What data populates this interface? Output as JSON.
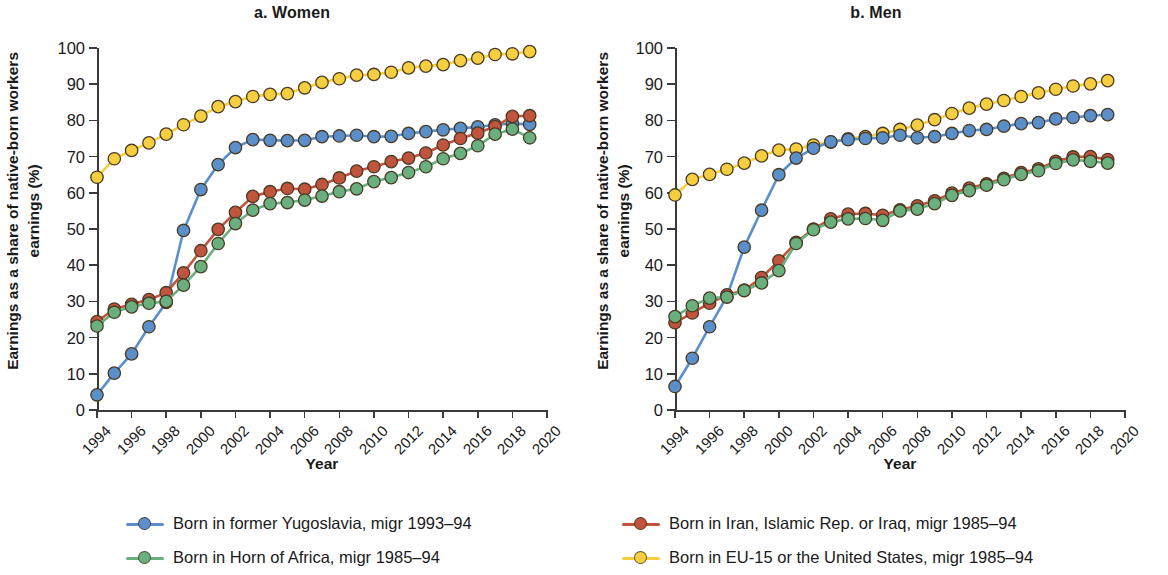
{
  "figure": {
    "ylabel": "Earnings as a share of native-born workers earnings (%)",
    "xlabel": "Year"
  },
  "panels": [
    {
      "key": "women",
      "title": "a. Women"
    },
    {
      "key": "men",
      "title": "b. Men"
    }
  ],
  "legend": [
    {
      "name": "Born in former Yugoslavia, migr 1993–94",
      "color": "#5b8fc9"
    },
    {
      "name": "Born in Iran, Islamic Rep. or Iraq, migr 1985–94",
      "color": "#c0543c"
    },
    {
      "name": "Born in Horn of Africa, migr 1985–94",
      "color": "#6aaf7e"
    },
    {
      "name": "Born in EU-15 or the United States, migr 1985–94",
      "color": "#f5cf3f"
    }
  ],
  "colors": {
    "yugoslavia": "#5b8fc9",
    "iran_iraq": "#c0543c",
    "horn_of_africa": "#6aaf7e",
    "eu15_us": "#f5cf3f",
    "axis": "#3a3a3a",
    "text": "#1a1a1a",
    "marker_stroke": "#4a3a24"
  },
  "chart_data": [
    {
      "type": "line",
      "title": "a. Women",
      "xlabel": "Year",
      "ylabel": "Earnings as a share of native-born workers earnings (%)",
      "xlim": [
        1994,
        2020
      ],
      "ylim": [
        0,
        100
      ],
      "yticks": [
        0,
        10,
        20,
        30,
        40,
        50,
        60,
        70,
        80,
        90,
        100
      ],
      "xticks": [
        1994,
        1996,
        1998,
        2000,
        2002,
        2004,
        2006,
        2008,
        2010,
        2012,
        2014,
        2016,
        2018,
        2020
      ],
      "xtick_labels": [
        "1994",
        "1996",
        "1998",
        "2000",
        "2002",
        "2004",
        "2006",
        "2008",
        "2010",
        "2012",
        "2014",
        "2016",
        "2018",
        "2020"
      ],
      "grid": false,
      "legend_position": "below",
      "x": [
        1994,
        1995,
        1996,
        1997,
        1998,
        1999,
        2000,
        2001,
        2002,
        2003,
        2004,
        2005,
        2006,
        2007,
        2008,
        2009,
        2010,
        2011,
        2012,
        2013,
        2014,
        2015,
        2016,
        2017,
        2018,
        2019
      ],
      "series": [
        {
          "name": "Born in former Yugoslavia, migr 1993–94",
          "color": "#5b8fc9",
          "values": [
            4.2,
            10.2,
            15.5,
            23.0,
            29.7,
            49.6,
            60.9,
            67.8,
            72.5,
            74.7,
            74.5,
            74.4,
            74.5,
            75.5,
            75.7,
            75.9,
            75.5,
            75.6,
            76.4,
            76.9,
            77.4,
            77.8,
            78.2,
            78.8,
            79.1,
            78.9
          ]
        },
        {
          "name": "Born in Iran, Islamic Rep. or Iraq, migr 1985–94",
          "color": "#c0543c",
          "values": [
            24.4,
            27.9,
            29.2,
            30.5,
            32.4,
            37.9,
            44.0,
            49.9,
            54.6,
            59.0,
            60.3,
            61.2,
            61.0,
            62.3,
            64.1,
            66.0,
            67.2,
            68.6,
            69.6,
            71.0,
            73.2,
            75.0,
            76.5,
            78.3,
            81.1,
            81.3
          ]
        },
        {
          "name": "Born in Horn of Africa, migr 1985–94",
          "color": "#6aaf7e",
          "values": [
            23.2,
            27.0,
            28.5,
            29.5,
            30.0,
            34.5,
            39.6,
            46.0,
            51.5,
            55.2,
            57.0,
            57.3,
            58.0,
            59.1,
            60.3,
            61.1,
            63.1,
            64.2,
            65.6,
            67.2,
            69.4,
            70.9,
            73.0,
            76.2,
            77.6,
            75.2
          ]
        },
        {
          "name": "Born in EU-15 or the United States, migr 1985–94",
          "color": "#f5cf3f",
          "values": [
            64.3,
            69.4,
            71.7,
            73.8,
            76.2,
            78.8,
            81.2,
            83.8,
            85.2,
            86.6,
            87.2,
            87.4,
            89.0,
            90.5,
            91.5,
            92.5,
            92.7,
            93.3,
            94.5,
            95.0,
            95.4,
            96.5,
            97.2,
            98.2,
            98.4,
            99.0
          ]
        }
      ]
    },
    {
      "type": "line",
      "title": "b. Men",
      "xlabel": "Year",
      "ylabel": "Earnings as a share of native-born workers earnings (%)",
      "xlim": [
        1994,
        2020
      ],
      "ylim": [
        0,
        100
      ],
      "yticks": [
        0,
        10,
        20,
        30,
        40,
        50,
        60,
        70,
        80,
        90,
        100
      ],
      "xticks": [
        1994,
        1996,
        1998,
        2000,
        2002,
        2004,
        2006,
        2008,
        2010,
        2012,
        2014,
        2016,
        2018,
        2020
      ],
      "xtick_labels": [
        "1994",
        "1996",
        "1998",
        "2000",
        "2002",
        "2004",
        "2006",
        "2008",
        "2010",
        "2012",
        "2014",
        "2016",
        "2018",
        "2020"
      ],
      "grid": false,
      "legend_position": "below",
      "x": [
        1994,
        1995,
        1996,
        1997,
        1998,
        1999,
        2000,
        2001,
        2002,
        2003,
        2004,
        2005,
        2006,
        2007,
        2008,
        2009,
        2010,
        2011,
        2012,
        2013,
        2014,
        2015,
        2016,
        2017,
        2018,
        2019
      ],
      "series": [
        {
          "name": "Born in former Yugoslavia, migr 1993–94",
          "color": "#5b8fc9",
          "values": [
            6.5,
            14.3,
            23.0,
            31.4,
            45.0,
            55.2,
            65.0,
            69.6,
            72.3,
            74.1,
            74.7,
            75.0,
            75.2,
            75.9,
            75.2,
            75.5,
            76.4,
            77.2,
            77.5,
            78.4,
            79.1,
            79.4,
            80.4,
            80.8,
            81.3,
            81.6
          ]
        },
        {
          "name": "Born in Iran, Islamic Rep. or Iraq, migr 1985–94",
          "color": "#c0543c",
          "values": [
            24.1,
            26.8,
            29.5,
            31.8,
            33.1,
            36.6,
            41.2,
            46.3,
            50.0,
            52.8,
            54.1,
            54.3,
            53.8,
            55.3,
            56.4,
            57.8,
            59.9,
            61.3,
            62.5,
            64.0,
            65.6,
            66.6,
            68.7,
            69.9,
            70.0,
            69.2
          ]
        },
        {
          "name": "Born in Horn of Africa, migr 1985–94",
          "color": "#6aaf7e",
          "values": [
            25.8,
            28.8,
            30.9,
            31.2,
            33.0,
            35.1,
            38.5,
            46.0,
            49.8,
            51.9,
            52.8,
            52.9,
            52.4,
            55.0,
            55.5,
            57.0,
            59.3,
            60.6,
            62.1,
            63.6,
            65.1,
            66.1,
            68.1,
            69.1,
            68.7,
            68.2
          ]
        },
        {
          "name": "Born in EU-15 or the United States, migr 1985–94",
          "color": "#f5cf3f",
          "values": [
            59.4,
            63.7,
            65.1,
            66.5,
            68.2,
            70.2,
            71.8,
            72.1,
            73.2,
            74.0,
            74.9,
            75.5,
            76.4,
            77.5,
            78.7,
            80.2,
            81.9,
            83.4,
            84.5,
            85.5,
            86.6,
            87.6,
            88.6,
            89.5,
            90.1,
            91.0
          ]
        }
      ]
    }
  ]
}
